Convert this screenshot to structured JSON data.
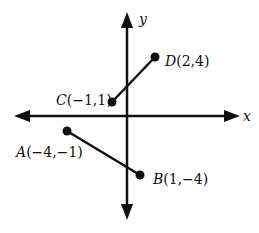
{
  "diagram": {
    "type": "coordinate-plane",
    "axes": {
      "x_label": "x",
      "y_label": "y"
    },
    "points": [
      {
        "id": "A",
        "label": "A(−4,−1)",
        "x": -4,
        "y": -1
      },
      {
        "id": "B",
        "label": "B(1,−4)",
        "x": 1,
        "y": -4
      },
      {
        "id": "C",
        "label": "C(−1,1)",
        "x": -1,
        "y": 1
      },
      {
        "id": "D",
        "label": "D(2,4)",
        "x": 2,
        "y": 4
      }
    ],
    "segments": [
      {
        "from": "A",
        "to": "B"
      },
      {
        "from": "C",
        "to": "D"
      }
    ],
    "colors": {
      "ink": "#111111",
      "background": "#ffffff"
    }
  }
}
